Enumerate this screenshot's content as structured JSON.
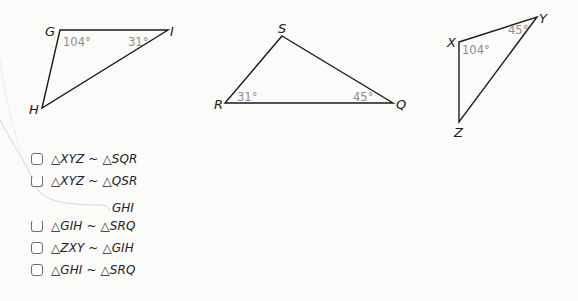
{
  "figures": {
    "triangle_GHI": {
      "vertices": {
        "G": "G",
        "H": "H",
        "I": "I"
      },
      "angles": {
        "G": "104°",
        "I": "31°"
      }
    },
    "triangle_SQR": {
      "vertices": {
        "S": "S",
        "R": "R",
        "Q": "Q"
      },
      "angles": {
        "R": "31°",
        "Q": "45°"
      }
    },
    "triangle_XYZ": {
      "vertices": {
        "X": "X",
        "Y": "Y",
        "Z": "Z"
      },
      "angles": {
        "X": "104°",
        "Y": "45°"
      }
    }
  },
  "options": [
    {
      "label": "△XYZ ~ △SQR",
      "checked": false
    },
    {
      "label": "△XYZ ~ △QSR",
      "checked": false
    },
    {
      "label": "GHI",
      "checked": false,
      "partially_obscured": true
    },
    {
      "label": "△GIH ~ △SRQ",
      "checked": false
    },
    {
      "label": "△ZXY ~ △GIH",
      "checked": false
    },
    {
      "label": "△GHI ~ △SRQ",
      "checked": false
    }
  ]
}
